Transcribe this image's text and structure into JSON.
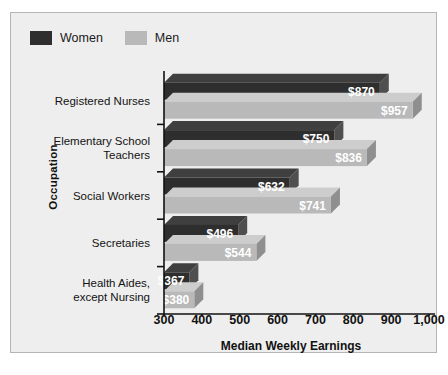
{
  "chart_data": {
    "type": "bar",
    "orientation": "horizontal",
    "title": "",
    "xlabel": "Median Weekly Earnings",
    "ylabel": "Occupation",
    "xlim": [
      300,
      1000
    ],
    "xticks": [
      "300",
      "400",
      "500",
      "600",
      "700",
      "800",
      "900",
      "1,000"
    ],
    "xtick_values": [
      300,
      400,
      500,
      600,
      700,
      800,
      900,
      1000
    ],
    "grid": false,
    "legend_position": "top-left",
    "categories": [
      "Registered Nurses",
      "Elementary School Teachers",
      "Social Workers",
      "Secretaries",
      "Health Aides, except Nursing"
    ],
    "category_lines": [
      [
        "Registered Nurses"
      ],
      [
        "Elementary School",
        "Teachers"
      ],
      [
        "Social Workers"
      ],
      [
        "Secretaries"
      ],
      [
        "Health Aides,",
        "except Nursing"
      ]
    ],
    "series": [
      {
        "name": "Women",
        "color": "#2e2e2e",
        "values": [
          870,
          750,
          632,
          496,
          367
        ],
        "labels": [
          "$870",
          "$750",
          "$632",
          "$496",
          "$367"
        ]
      },
      {
        "name": "Men",
        "color": "#b9b9b9",
        "values": [
          957,
          836,
          741,
          544,
          380
        ],
        "labels": [
          "$957",
          "$836",
          "$741",
          "$544",
          "$380"
        ]
      }
    ]
  },
  "legend": {
    "entries": [
      {
        "label": "Women",
        "swatch": "women-swatch"
      },
      {
        "label": "Men",
        "swatch": "men-swatch"
      }
    ]
  },
  "colors": {
    "panel_background": "#eeeeee",
    "panel_border": "#b5b5b5",
    "women_front": "#2e2e2e",
    "women_top": "#3f3f3f",
    "women_side": "#4f4f4f",
    "men_front": "#b9b9b9",
    "men_top": "#cdcdcd",
    "men_side": "#8f8f8f",
    "axis": "#111111",
    "label_text_on_dark": "#ffffff",
    "label_text_on_light": "#ffffff"
  }
}
